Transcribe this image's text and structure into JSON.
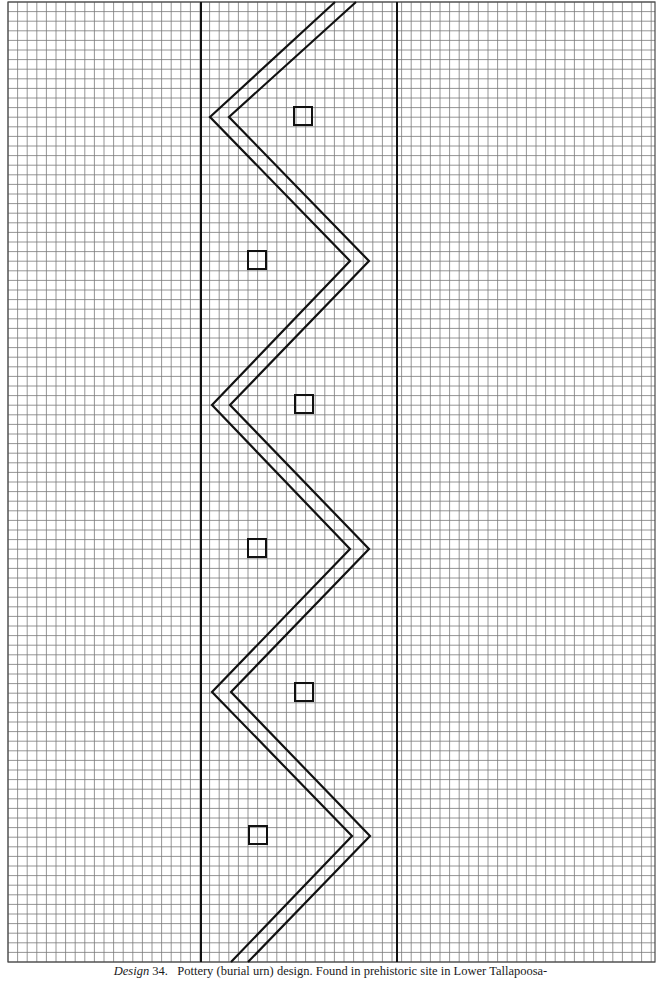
{
  "figure": {
    "grid": {
      "x0": 8,
      "y0": 2,
      "x1": 655,
      "y1": 962,
      "cell": 9.6,
      "color": "#7a7a7a",
      "border_color": "#4a4a4a"
    },
    "ink_color": "#111111",
    "band_lines": [
      {
        "x": 201,
        "y1": 2,
        "y2": 962
      },
      {
        "x": 397,
        "y1": 2,
        "y2": 962
      }
    ],
    "zigzag_outer": [
      [
        335,
        2
      ],
      [
        210,
        117
      ],
      [
        350,
        261
      ],
      [
        212,
        405
      ],
      [
        350,
        549
      ],
      [
        212,
        692
      ],
      [
        352,
        836
      ],
      [
        231,
        962
      ]
    ],
    "zigzag_inner": [
      [
        356,
        2
      ],
      [
        229,
        117
      ],
      [
        369,
        261
      ],
      [
        230,
        405
      ],
      [
        369,
        549
      ],
      [
        231,
        692
      ],
      [
        370,
        836
      ],
      [
        248,
        962
      ]
    ],
    "squares": [
      {
        "x": 294,
        "y": 107,
        "size": 18
      },
      {
        "x": 248,
        "y": 251,
        "size": 18
      },
      {
        "x": 295,
        "y": 395,
        "size": 18
      },
      {
        "x": 248,
        "y": 539,
        "size": 18
      },
      {
        "x": 295,
        "y": 683,
        "size": 18
      },
      {
        "x": 249,
        "y": 826,
        "size": 18
      }
    ]
  },
  "caption": {
    "label": "Design",
    "number": "34.",
    "text": "Pottery (burial urn) design. Found in prehistoric site in Lower Tallapoosa-"
  }
}
